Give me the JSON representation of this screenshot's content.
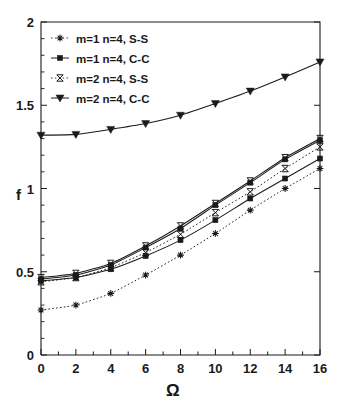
{
  "chart_data": {
    "type": "line",
    "title": "",
    "subtitle": "",
    "xlabel": "Ω",
    "ylabel": "f",
    "xlim": [
      0,
      16
    ],
    "ylim": [
      0,
      2
    ],
    "xticks": [
      0,
      2,
      4,
      6,
      8,
      10,
      12,
      14,
      16
    ],
    "yticks": [
      0,
      0.5,
      1,
      1.5,
      2
    ],
    "xticklabels": [
      "0",
      "2",
      "4",
      "6",
      "8",
      "10",
      "12",
      "14",
      "16"
    ],
    "yticklabels": [
      "0",
      "0.5",
      "1",
      "1.5",
      "2"
    ],
    "grid": false,
    "legend_position": "upper-left",
    "x": [
      0,
      2,
      4,
      6,
      8,
      10,
      12,
      14,
      16
    ],
    "series": [
      {
        "name": "m=1  n=4,   S-S",
        "marker": "asterisk",
        "linestyle": "dotted",
        "color": "#1a1a1a",
        "values": [
          0.27,
          0.3,
          0.37,
          0.48,
          0.6,
          0.73,
          0.87,
          1.0,
          1.12
        ]
      },
      {
        "name": "m=1  n=4,   C-C",
        "marker": "filled-square",
        "linestyle": "solid",
        "color": "#1a1a1a",
        "values": [
          0.445,
          0.465,
          0.515,
          0.595,
          0.69,
          0.81,
          0.94,
          1.06,
          1.18
        ]
      },
      {
        "name": "m=2  n=4,   S-S",
        "marker": "open-bowtie",
        "linestyle": "dotted",
        "color": "#1a1a1a",
        "values": [
          0.44,
          0.465,
          0.525,
          0.615,
          0.725,
          0.855,
          0.98,
          1.12,
          1.25
        ]
      },
      {
        "name": "m=2  n=4,   C-C",
        "marker": "filled-triangle-down",
        "linestyle": "solid",
        "color": "#1a1a1a",
        "values": [
          1.32,
          1.325,
          1.355,
          1.39,
          1.44,
          1.51,
          1.585,
          1.67,
          1.76
        ]
      },
      {
        "name": "m=2  n=4,   S-S  upper",
        "marker": "open-bowtie",
        "linestyle": "solid",
        "color": "#1a1a1a",
        "values": [
          0.465,
          0.49,
          0.55,
          0.655,
          0.775,
          0.91,
          1.045,
          1.185,
          1.3
        ]
      },
      {
        "name": "m=1  n=4,   C-C  upper",
        "marker": "filled-square",
        "linestyle": "solid",
        "color": "#1a1a1a",
        "values": [
          0.455,
          0.48,
          0.54,
          0.645,
          0.76,
          0.9,
          1.035,
          1.175,
          1.29
        ]
      }
    ],
    "legend_entries": [
      "m=1  n=4,   S-S",
      "m=1  n=4,   C-C",
      "m=2  n=4,   S-S",
      "m=2  n=4,   C-C"
    ]
  },
  "axes": {
    "ylabel": "f",
    "xlabel": "Ω"
  }
}
